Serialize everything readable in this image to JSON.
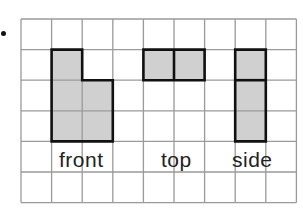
{
  "bullet": "•",
  "grid": {
    "cols": 9,
    "rows": 6,
    "cell": 30.6,
    "line_color": "#9a9a9a",
    "shade_color": "#d0d0d0",
    "outline_color": "#111111"
  },
  "views": [
    {
      "name": "front",
      "label": "front",
      "cells": [
        [
          1,
          1
        ],
        [
          1,
          2
        ],
        [
          1,
          3
        ],
        [
          2,
          2
        ],
        [
          2,
          3
        ]
      ],
      "outline": [
        [
          1,
          1
        ],
        [
          2,
          1
        ],
        [
          2,
          2
        ],
        [
          3,
          2
        ],
        [
          3,
          4
        ],
        [
          1,
          4
        ]
      ]
    },
    {
      "name": "top",
      "label": "top",
      "cells": [
        [
          4,
          1
        ],
        [
          5,
          1
        ]
      ],
      "outline": [
        [
          4,
          1
        ],
        [
          6,
          1
        ],
        [
          6,
          2
        ],
        [
          4,
          2
        ]
      ],
      "divider": [
        [
          5,
          1
        ],
        [
          5,
          2
        ]
      ]
    },
    {
      "name": "side",
      "label": "side",
      "cells": [
        [
          7,
          1
        ],
        [
          7,
          2
        ],
        [
          7,
          3
        ]
      ],
      "outline": [
        [
          7,
          1
        ],
        [
          8,
          1
        ],
        [
          8,
          4
        ],
        [
          7,
          4
        ]
      ],
      "divider": [
        [
          7,
          2
        ],
        [
          8,
          2
        ]
      ]
    }
  ],
  "labels": {
    "front": "front",
    "top": "top",
    "side": "side"
  }
}
